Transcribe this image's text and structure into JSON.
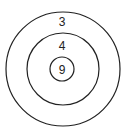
{
  "diagram": {
    "type": "concentric-circles",
    "rings": [
      {
        "label": "3",
        "position": "outer"
      },
      {
        "label": "4",
        "position": "middle"
      },
      {
        "label": "9",
        "position": "inner"
      }
    ],
    "stroke_color": "#222222",
    "background": "#ffffff"
  }
}
